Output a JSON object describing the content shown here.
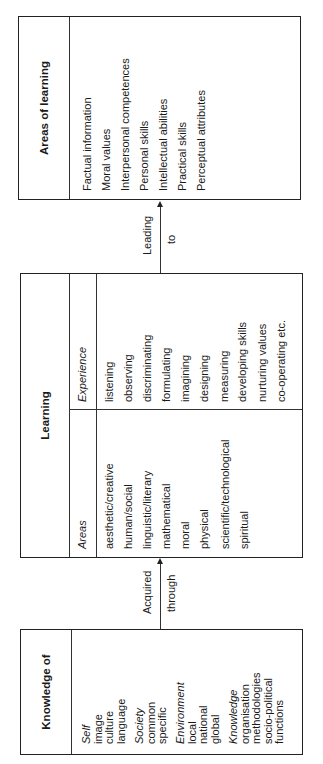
{
  "diagram": {
    "orientation": "rotated-90-ccw",
    "box_knowledge": {
      "title": "Knowledge of",
      "groups": [
        {
          "heading": "Self",
          "items": [
            "image",
            "culture",
            "language"
          ]
        },
        {
          "heading": "Society",
          "items": [
            "common",
            "specific"
          ]
        },
        {
          "heading": "Environment",
          "items": [
            "local",
            "national",
            "global"
          ]
        },
        {
          "heading": "Knowledge",
          "items": [
            "organisation",
            "methodologies",
            "socio-political",
            "functions"
          ]
        }
      ]
    },
    "connector_1": {
      "label_top": "Acquired",
      "label_bottom": "through"
    },
    "box_learning": {
      "title": "Learning",
      "columns": [
        {
          "header": "Areas",
          "items": [
            "aesthetic/creative",
            "human/social",
            "linguistic/literary",
            "mathematical",
            "moral",
            "physical",
            "scientific/technological",
            "spiritual"
          ]
        },
        {
          "header": "Experience",
          "items": [
            "listening",
            "observing",
            "discriminating",
            "formulating",
            "imagining",
            "designing",
            "measuring",
            "developing skills",
            "nurturing values",
            "co-operating etc."
          ]
        }
      ]
    },
    "connector_2": {
      "label_top": "Leading",
      "label_bottom": "to"
    },
    "box_areas": {
      "title": "Areas of learning",
      "items": [
        "Factual information",
        "Moral values",
        "Interpersonal competences",
        "Personal skills",
        "Intellectual abilities",
        "Practical skills",
        "Perceptual attributes"
      ]
    }
  }
}
